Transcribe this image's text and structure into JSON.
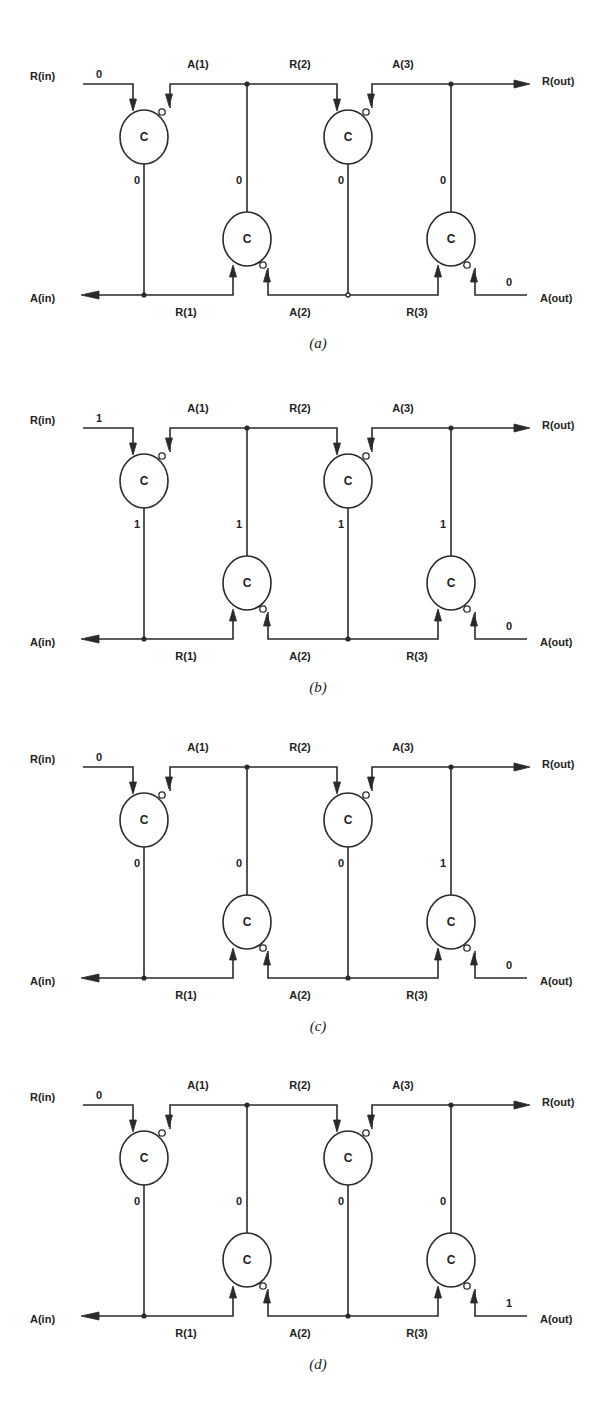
{
  "figure": {
    "signal_labels": {
      "r_in": "R(in)",
      "a_in": "A(in)",
      "r_out": "R(out)",
      "a_out": "A(out)",
      "a1": "A(1)",
      "r2": "R(2)",
      "a3": "A(3)",
      "r1": "R(1)",
      "a2": "A(2)",
      "r3": "R(3)"
    },
    "gate_label": "C",
    "panels": [
      {
        "caption": "(a)",
        "top": 84,
        "r_in_value": "0",
        "vertical_values": [
          "0",
          "0",
          "0",
          "0"
        ],
        "a_out_value": "0"
      },
      {
        "caption": "(b)",
        "top": 428,
        "r_in_value": "1",
        "vertical_values": [
          "1",
          "1",
          "1",
          "1"
        ],
        "a_out_value": "0"
      },
      {
        "caption": "(c)",
        "top": 767,
        "r_in_value": "0",
        "vertical_values": [
          "0",
          "0",
          "0",
          "1"
        ],
        "a_out_value": "0"
      },
      {
        "caption": "(d)",
        "top": 1105,
        "r_in_value": "0",
        "vertical_values": [
          "0",
          "0",
          "0",
          "0"
        ],
        "a_out_value": "1"
      }
    ]
  }
}
